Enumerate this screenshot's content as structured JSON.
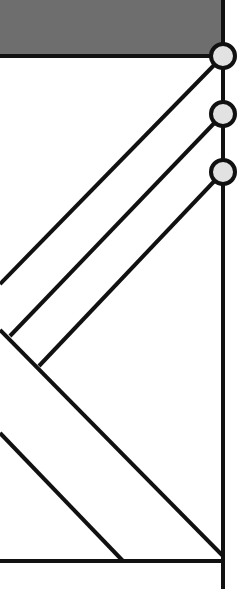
{
  "diagram": {
    "colors": {
      "background": "#ffffff",
      "block_fill": "#6e6e6e",
      "stroke": "#111111",
      "node_fill": "#e2e2e2"
    },
    "block": {
      "x": 0,
      "y": 0,
      "w": 223,
      "h": 56
    },
    "spine": {
      "x": 223,
      "y1": 0,
      "y2": 589
    },
    "nodes": [
      {
        "cx": 223,
        "cy": 56,
        "r": 12
      },
      {
        "cx": 223,
        "cy": 114,
        "r": 12
      },
      {
        "cx": 223,
        "cy": 172,
        "r": 12
      }
    ],
    "lines": [
      {
        "x1": 0,
        "y1": 56,
        "x2": 223,
        "y2": 56
      },
      {
        "x1": 223,
        "y1": 56,
        "x2": 0,
        "y2": 284
      },
      {
        "x1": 223,
        "y1": 114,
        "x2": 10,
        "y2": 336
      },
      {
        "x1": 223,
        "y1": 172,
        "x2": 39,
        "y2": 366
      },
      {
        "x1": 0,
        "y1": 330,
        "x2": 223,
        "y2": 556
      },
      {
        "x1": 0,
        "y1": 433,
        "x2": 123,
        "y2": 561
      },
      {
        "x1": 0,
        "y1": 561,
        "x2": 223,
        "y2": 561
      }
    ]
  }
}
